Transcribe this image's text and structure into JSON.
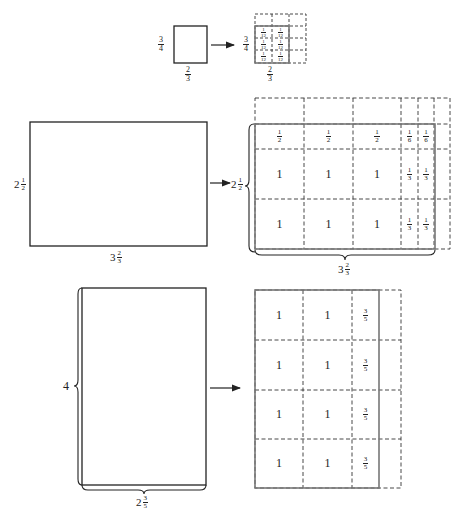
{
  "diagrams": [
    {
      "id": "small",
      "original": {
        "height_label": {
          "n": "3",
          "d": "4"
        },
        "width_label": {
          "n": "2",
          "d": "3"
        }
      },
      "grid": {
        "height_label": {
          "n": "3",
          "d": "4"
        },
        "width_label": {
          "n": "2",
          "d": "3"
        },
        "cell_label": {
          "n": "1",
          "d": "12"
        }
      }
    },
    {
      "id": "middle",
      "original": {
        "height_label": {
          "w": "2",
          "n": "1",
          "d": "2"
        },
        "width_label": {
          "w": "3",
          "n": "2",
          "d": "3"
        }
      },
      "grid": {
        "height_label": {
          "w": "2",
          "n": "1",
          "d": "2"
        },
        "width_label": {
          "w": "3",
          "n": "2",
          "d": "3"
        },
        "rows": [
          [
            {
              "n": "1",
              "d": "2"
            },
            {
              "n": "1",
              "d": "2"
            },
            {
              "n": "1",
              "d": "2"
            },
            {
              "n": "1",
              "d": "6"
            },
            {
              "n": "1",
              "d": "6"
            }
          ],
          [
            "1",
            "1",
            "1",
            {
              "n": "1",
              "d": "3"
            },
            {
              "n": "1",
              "d": "3"
            }
          ],
          [
            "1",
            "1",
            "1",
            {
              "n": "1",
              "d": "3"
            },
            {
              "n": "1",
              "d": "3"
            }
          ]
        ]
      }
    },
    {
      "id": "bottom",
      "original": {
        "height_label": "4",
        "width_label": {
          "w": "2",
          "n": "3",
          "d": "5"
        }
      },
      "grid": {
        "rows": [
          [
            "1",
            "1",
            {
              "n": "3",
              "d": "5"
            }
          ],
          [
            "1",
            "1",
            {
              "n": "3",
              "d": "5"
            }
          ],
          [
            "1",
            "1",
            {
              "n": "3",
              "d": "5"
            }
          ],
          [
            "1",
            "1",
            {
              "n": "3",
              "d": "5"
            }
          ]
        ]
      }
    }
  ],
  "colors": {
    "line": "#222222",
    "grid_solid": "#777777",
    "dashed": "#333333"
  }
}
